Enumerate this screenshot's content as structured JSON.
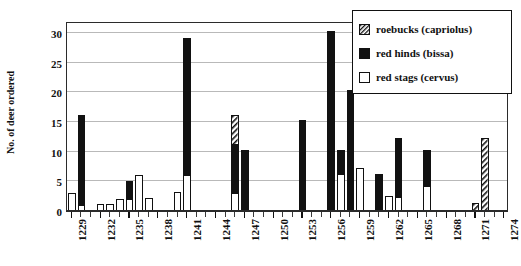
{
  "chart_data": {
    "type": "bar",
    "title": "",
    "xlabel": "",
    "ylabel": "No. of deer ordered",
    "ylim": [
      0,
      32
    ],
    "yticks": [
      0,
      5,
      10,
      15,
      20,
      25,
      30
    ],
    "grid": true,
    "stacked": true,
    "legend_position": "top-right",
    "x_tick_labels": [
      "1229",
      "1232",
      "1235",
      "1238",
      "1241",
      "1244",
      "1247",
      "1250",
      "1253",
      "1256",
      "1259",
      "1262",
      "1265",
      "1268",
      "1271",
      "1274"
    ],
    "x_tick_label_step": 3,
    "x_domain": [
      1229,
      1274
    ],
    "categories": [
      1229,
      1230,
      1231,
      1232,
      1233,
      1234,
      1235,
      1236,
      1237,
      1238,
      1239,
      1240,
      1241,
      1242,
      1243,
      1244,
      1245,
      1246,
      1247,
      1248,
      1249,
      1250,
      1251,
      1252,
      1253,
      1254,
      1255,
      1256,
      1257,
      1258,
      1259,
      1260,
      1261,
      1262,
      1263,
      1264,
      1265,
      1266,
      1267,
      1268,
      1269,
      1270,
      1271,
      1272,
      1273,
      1274
    ],
    "series": [
      {
        "name": "red stags (cervus)",
        "fill": "white",
        "values": [
          3.1,
          1.0,
          0,
          1.1,
          1.2,
          2.1,
          2.1,
          6.1,
          2.2,
          0,
          0,
          3.2,
          6.0,
          0,
          0,
          0,
          0,
          3.1,
          0,
          0,
          0,
          0,
          0,
          0,
          0,
          0,
          0,
          0,
          6.2,
          0,
          7.3,
          0,
          0,
          2.5,
          2.4,
          0,
          0,
          4.2,
          0,
          0,
          0,
          0,
          0,
          0,
          0,
          0
        ]
      },
      {
        "name": "red hinds (bissa)",
        "fill": "black",
        "values": [
          0,
          15.1,
          0,
          0,
          0,
          0,
          2.9,
          0,
          0,
          0,
          0,
          0,
          23.2,
          0,
          0,
          0,
          0,
          8.0,
          10.2,
          0,
          0,
          0,
          0,
          0,
          15.3,
          0,
          0,
          30.3,
          4.1,
          20.3,
          0,
          0,
          6.3,
          0,
          9.9,
          0,
          0,
          6.1,
          0,
          0,
          0,
          0,
          0,
          0,
          0,
          0
        ]
      },
      {
        "name": "roebucks (capriolus)",
        "fill": "hatched",
        "values": [
          0,
          0,
          0,
          0,
          0,
          0,
          0,
          0,
          0,
          0,
          0,
          0,
          0,
          0,
          0,
          0,
          0,
          5.1,
          0,
          0,
          0,
          0,
          0,
          0,
          0,
          0,
          0,
          0,
          0,
          0,
          0,
          0,
          0,
          0,
          0,
          0,
          0,
          0,
          0,
          0,
          0,
          0,
          1.4,
          12.3,
          0,
          0
        ]
      }
    ],
    "bar_totals": [
      3.1,
      16.1,
      0,
      1.1,
      1.2,
      2.1,
      5.0,
      6.1,
      2.2,
      0,
      0,
      3.2,
      29.2,
      0,
      0,
      0,
      0,
      16.2,
      10.2,
      0,
      0,
      0,
      0,
      0,
      15.3,
      0,
      0,
      30.3,
      10.3,
      20.3,
      7.3,
      0,
      6.3,
      2.5,
      12.3,
      0,
      0,
      10.3,
      0,
      0,
      0,
      0,
      1.4,
      12.3,
      0,
      0
    ]
  },
  "legend": {
    "items": [
      {
        "label": "roebucks (capriolus)",
        "swatch": "hatched-swatch"
      },
      {
        "label": "red hinds (bissa)",
        "swatch": "black-swatch"
      },
      {
        "label": "red stags (cervus)",
        "swatch": "white-swatch"
      }
    ]
  },
  "colors": {
    "black": "#111111",
    "white": "#ffffff",
    "grid": "#b9b9b9",
    "frame": "#2b2b2b"
  }
}
